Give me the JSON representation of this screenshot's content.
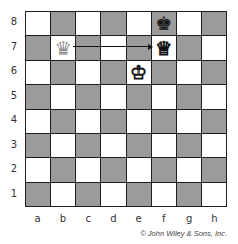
{
  "board": {
    "ranks": [
      "8",
      "7",
      "6",
      "5",
      "4",
      "3",
      "2",
      "1"
    ],
    "files": [
      "a",
      "b",
      "c",
      "d",
      "e",
      "f",
      "g",
      "h"
    ],
    "light_color": "#ffffff",
    "dark_color": "#9b9b9b",
    "pieces": [
      {
        "square": "f8",
        "type": "king",
        "color": "black",
        "glyph": "♚"
      },
      {
        "square": "f7",
        "type": "queen",
        "color": "white",
        "glyph": "♕"
      },
      {
        "square": "e6",
        "type": "king",
        "color": "white",
        "glyph": "♔"
      },
      {
        "square": "b7",
        "type": "queen",
        "color": "ghost",
        "glyph": "♛"
      }
    ],
    "arrow": {
      "from": "b7",
      "to": "f7"
    }
  },
  "credit": "© John Wiley & Sons, Inc."
}
